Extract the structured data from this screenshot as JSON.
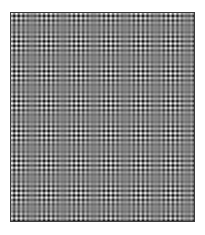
{
  "image": {
    "description": "Grayscale plaid interference (moire) pattern of crossed sinusoidal gratings inside a thin dark frame",
    "background": "#ffffff",
    "frame_color": "#3a3a3a",
    "mid_gray": 128,
    "pattern": {
      "cell_period_px": 4.6,
      "beat_period_x_px": 62,
      "beat_period_y_px": 60,
      "beat_max_x_px": [
        5,
        67,
        129
      ],
      "beat_max_y_px": [
        60,
        120,
        180
      ],
      "contrast": 1.0
    }
  }
}
